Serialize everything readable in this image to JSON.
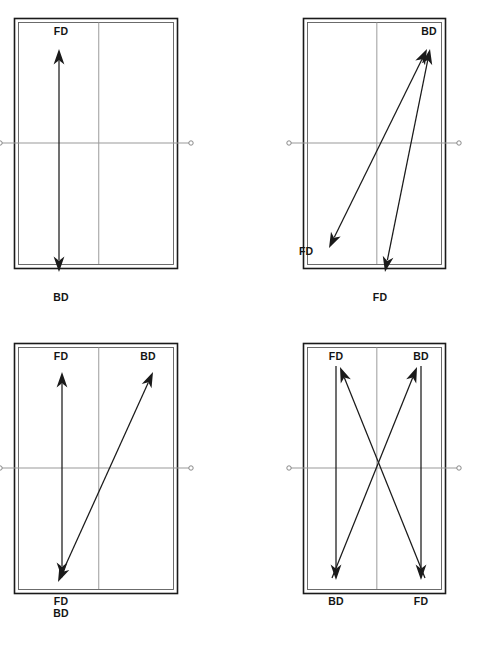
{
  "figure": {
    "title": "",
    "width": 489,
    "height": 650,
    "background": "#ffffff",
    "line_color": "#1a1a1a",
    "net_color": "#9a9a9a",
    "label_color": "#141414",
    "label_abbreviations": {
      "FD": "Forehand Drive",
      "BD": "Backhand Drive"
    }
  },
  "courts": [
    {
      "id": "court-1",
      "panel": "top-left",
      "origin": {
        "x": 14,
        "y": 22
      },
      "court": {
        "x": 14,
        "y": 18,
        "w": 163,
        "h": 250
      },
      "labels": [
        {
          "name": "label-fd-top",
          "text": "FD",
          "x": 61,
          "y": 26,
          "align": "center"
        },
        {
          "name": "label-bd-bottom",
          "text": "BD",
          "x": 61,
          "y": 292,
          "align": "center"
        }
      ],
      "arrows": [
        {
          "name": "arrow-straight-forehand-backhand",
          "from": {
            "x": 59,
            "y": 272
          },
          "to": {
            "x": 59,
            "y": 49
          },
          "heads": "both"
        }
      ]
    },
    {
      "id": "court-2",
      "panel": "top-right",
      "origin": {
        "x": 303,
        "y": 22
      },
      "court": {
        "x": 303,
        "y": 18,
        "w": 142,
        "h": 250
      },
      "labels": [
        {
          "name": "label-bd-topright",
          "text": "BD",
          "x": 429,
          "y": 26,
          "align": "center"
        },
        {
          "name": "label-fd-bottomleft",
          "text": "FD",
          "x": 299,
          "y": 246,
          "align": "left"
        },
        {
          "name": "label-fd-bottomcenter",
          "text": "FD",
          "x": 380,
          "y": 292,
          "align": "center"
        }
      ],
      "arrows": [
        {
          "name": "arrow-crosscourt-backhand",
          "from": {
            "x": 329,
            "y": 248
          },
          "to": {
            "x": 427,
            "y": 49
          },
          "heads": "both"
        },
        {
          "name": "arrow-straight-backhand",
          "from": {
            "x": 385,
            "y": 272
          },
          "to": {
            "x": 430,
            "y": 49
          },
          "heads": "both"
        }
      ]
    },
    {
      "id": "court-3",
      "panel": "bottom-left",
      "origin": {
        "x": 14,
        "y": 347
      },
      "court": {
        "x": 14,
        "y": 343,
        "w": 163,
        "h": 250
      },
      "labels": [
        {
          "name": "label-fd-topleft",
          "text": "FD",
          "x": 61,
          "y": 351,
          "align": "center"
        },
        {
          "name": "label-bd-topright",
          "text": "BD",
          "x": 148,
          "y": 351,
          "align": "center"
        },
        {
          "name": "label-fd-bottomleft",
          "text": "FD",
          "x": 61,
          "y": 596,
          "align": "center"
        },
        {
          "name": "label-bd-bottomleft",
          "text": "BD",
          "x": 61,
          "y": 608,
          "align": "center"
        }
      ],
      "arrows": [
        {
          "name": "arrow-straight-forehand",
          "from": {
            "x": 62,
            "y": 578
          },
          "to": {
            "x": 62,
            "y": 372
          },
          "heads": "both"
        },
        {
          "name": "arrow-crosscourt-backhand",
          "from": {
            "x": 58,
            "y": 582
          },
          "to": {
            "x": 153,
            "y": 372
          },
          "heads": "both"
        }
      ]
    },
    {
      "id": "court-4",
      "panel": "bottom-right",
      "origin": {
        "x": 303,
        "y": 347
      },
      "court": {
        "x": 303,
        "y": 343,
        "w": 142,
        "h": 250
      },
      "labels": [
        {
          "name": "label-fd-topleft",
          "text": "FD",
          "x": 336,
          "y": 351,
          "align": "center"
        },
        {
          "name": "label-bd-topright",
          "text": "BD",
          "x": 421,
          "y": 351,
          "align": "center"
        },
        {
          "name": "label-bd-bottomleft",
          "text": "BD",
          "x": 336,
          "y": 596,
          "align": "center"
        },
        {
          "name": "label-fd-bottomright",
          "text": "FD",
          "x": 421,
          "y": 596,
          "align": "center"
        }
      ],
      "arrows": [
        {
          "name": "arrow-straight-left-down",
          "from": {
            "x": 336,
            "y": 366
          },
          "to": {
            "x": 336,
            "y": 580
          },
          "heads": "end"
        },
        {
          "name": "arrow-straight-right-down",
          "from": {
            "x": 421,
            "y": 366
          },
          "to": {
            "x": 421,
            "y": 580
          },
          "heads": "end"
        },
        {
          "name": "arrow-crosscourt-up-left",
          "from": {
            "x": 425,
            "y": 578
          },
          "to": {
            "x": 340,
            "y": 367
          },
          "heads": "end"
        },
        {
          "name": "arrow-crosscourt-up-right",
          "from": {
            "x": 332,
            "y": 578
          },
          "to": {
            "x": 417,
            "y": 367
          },
          "heads": "end"
        }
      ]
    }
  ],
  "court_geometry": {
    "outer_stroke": 1.6,
    "inner_stroke": 0.9,
    "inner_inset": 4,
    "centre_line": true,
    "centre_line_ratio": 0.52,
    "net_ratio": 0.5,
    "net_overhang": 14,
    "post_radius": 2.2
  }
}
